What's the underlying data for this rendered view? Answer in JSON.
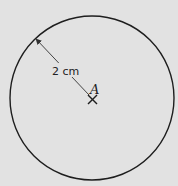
{
  "diagram": {
    "radius_label": "2 cm",
    "center_label": "A",
    "colors": {
      "background": "#e2e2e2",
      "stroke": "#1e1e1e",
      "arrow": "#444444"
    }
  }
}
